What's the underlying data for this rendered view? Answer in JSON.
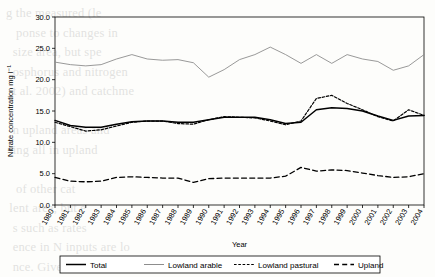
{
  "bleed_text": "g the measured (le\n   ponse to changes in\n  size area, but spe\n  osphorus and nitrogen\n  t al. 2002) and catchme\n\n  n upland areas and\n  ing all in upland\n\n   of other cat\n lent area, but e\n  s such as rates\n  ence in N inputs are lo\n  nce. Given that no\n  so that upland\n\n   ding we found an\n   d that the mea\n  are the seasonal\n   sure that the m\n   nlike the long\n   ffers longitudinal\n  ssion values of\n  ase many water\n  o be highly us\n  veral years fo\n  rally. Their d\n   sults also sugges\n   e that the long",
  "chart_data": {
    "type": "line",
    "title": "",
    "xlabel": "Year",
    "ylabel": "Nitrate concentration mg l⁻¹",
    "categories": [
      1980,
      1981,
      1982,
      1983,
      1984,
      1985,
      1986,
      1987,
      1988,
      1989,
      1990,
      1991,
      1992,
      1993,
      1994,
      1995,
      1996,
      1997,
      1998,
      1999,
      2000,
      2001,
      2002,
      2003,
      2004
    ],
    "xlim": [
      1980,
      2004
    ],
    "ylim": [
      0.0,
      30.0
    ],
    "yticks": [
      "0.0",
      "5.0",
      "10.0",
      "15.0",
      "20.0",
      "25.0",
      "30.0"
    ],
    "ytick_values": [
      0,
      5,
      10,
      15,
      20,
      25,
      30
    ],
    "grid": false,
    "legend_position": "bottom",
    "series": [
      {
        "name": "Total",
        "style": "solid",
        "color": "#000000",
        "width": 1.5,
        "values": [
          13.5,
          12.7,
          12.4,
          12.4,
          12.9,
          13.3,
          13.4,
          13.4,
          13.2,
          13.2,
          13.6,
          14.0,
          14.0,
          14.0,
          13.6,
          13.0,
          13.2,
          15.2,
          15.5,
          15.4,
          15.0,
          14.2,
          13.5,
          14.2,
          14.3
        ]
      },
      {
        "name": "Lowland arable",
        "style": "solid",
        "color": "#8d8d8d",
        "width": 0.9,
        "values": [
          22.8,
          22.4,
          22.2,
          22.4,
          23.3,
          24.0,
          23.3,
          23.1,
          23.2,
          22.7,
          20.4,
          21.6,
          23.2,
          24.0,
          25.2,
          24.0,
          22.6,
          24.0,
          22.6,
          24.0,
          23.3,
          22.9,
          21.5,
          22.2,
          24.0
        ]
      },
      {
        "name": "Lowland pastural",
        "style": "dotted",
        "color": "#000000",
        "width": 1.2,
        "values": [
          13.2,
          12.5,
          11.8,
          12.0,
          12.6,
          13.2,
          13.4,
          13.4,
          13.0,
          12.9,
          13.6,
          14.1,
          14.0,
          13.9,
          13.4,
          12.8,
          13.4,
          17.0,
          17.5,
          16.2,
          15.2,
          14.1,
          13.4,
          15.2,
          14.3
        ]
      },
      {
        "name": "Upland",
        "style": "dashed",
        "color": "#000000",
        "width": 1.3,
        "values": [
          4.4,
          3.8,
          3.7,
          3.8,
          4.4,
          4.5,
          4.4,
          4.3,
          4.3,
          3.6,
          4.2,
          4.3,
          4.3,
          4.3,
          4.3,
          4.6,
          6.0,
          5.4,
          5.6,
          5.5,
          5.1,
          4.7,
          4.4,
          4.5,
          5.0
        ]
      }
    ]
  },
  "legend": {
    "items": [
      {
        "label": "Total"
      },
      {
        "label": "Lowland arable"
      },
      {
        "label": "Lowland pastural"
      },
      {
        "label": "Upland"
      }
    ]
  }
}
